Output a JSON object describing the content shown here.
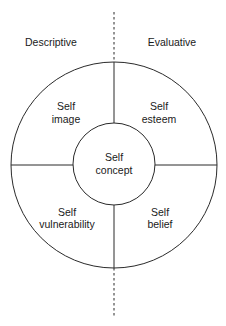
{
  "diagram": {
    "colors": {
      "stroke": "#2a2a2a",
      "text": "#1a1a1a",
      "background": "#ffffff"
    },
    "axis_labels": {
      "left": "Descriptive",
      "right": "Evaluative"
    },
    "center": {
      "line1": "Self",
      "line2": "concept"
    },
    "quadrants": {
      "top_left": {
        "line1": "Self",
        "line2": "image"
      },
      "top_right": {
        "line1": "Self",
        "line2": "esteem"
      },
      "bottom_left": {
        "line1": "Self",
        "line2": "vulnerability"
      },
      "bottom_right": {
        "line1": "Self",
        "line2": "belief"
      }
    }
  }
}
